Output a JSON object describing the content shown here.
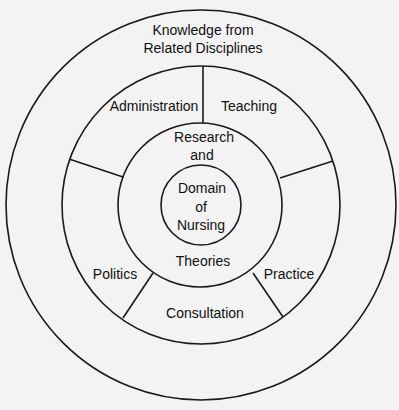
{
  "diagram": {
    "type": "concentric-circles",
    "background": "#f3f3f3",
    "line_color": "#1a1a1a",
    "outer_ring": {
      "label_lines": [
        "Knowledge from",
        "Related Disciplines"
      ]
    },
    "middle_ring": {
      "segments": [
        {
          "label": "Administration"
        },
        {
          "label": "Teaching"
        },
        {
          "label": "Practice"
        },
        {
          "label": "Consultation"
        },
        {
          "label": "Politics"
        }
      ]
    },
    "inner_ring": {
      "label_top_lines": [
        "Research",
        "and"
      ],
      "label_bottom": "Theories"
    },
    "core": {
      "label_lines": [
        "Domain",
        "of",
        "Nursing"
      ]
    }
  }
}
